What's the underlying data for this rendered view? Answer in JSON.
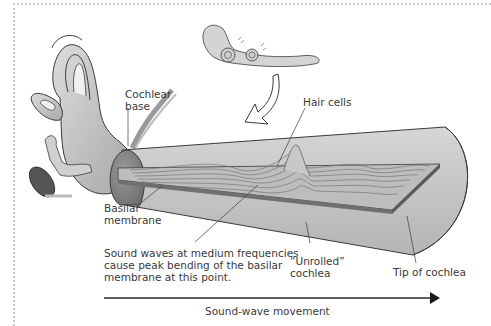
{
  "diagram": {
    "type": "anatomical-illustration",
    "labels": {
      "cochlear_base": [
        "Cochlear",
        "base"
      ],
      "hair_cells": "Hair cells",
      "basilar_membrane": [
        "Basilar",
        "membrane"
      ],
      "sound_waves_note": [
        "Sound waves at medium frequencies",
        "cause peak bending of the basilar",
        "membrane at this point."
      ],
      "unrolled_cochlea": [
        "“Unrolled”",
        "cochlea"
      ],
      "tip_of_cochlea": "Tip of cochlea",
      "sound_wave_movement": "Sound-wave movement"
    },
    "icons": {
      "inner_ear": "inner-ear-illustration",
      "unrolling_cochlea": "unrolling-cochlea-illustration",
      "curved_arrow": "curved-down-arrow",
      "direction_arrow": "right-arrow"
    },
    "colors": {
      "tube_fill": "#c9c9c9",
      "tube_shade": "#a8a8a8",
      "membrane_fill": "#bdbdbd",
      "membrane_edge": "#707070",
      "base_fill": "#8f8f8f",
      "outline": "#3a3a3a",
      "text": "#3a3a3a",
      "border_dots": "#c8c8c8"
    }
  }
}
